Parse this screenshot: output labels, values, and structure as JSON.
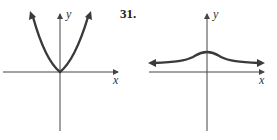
{
  "figures": [
    {
      "id": "left",
      "axis_labels": {
        "x": "x",
        "y": "y"
      },
      "curve": "parabola"
    },
    {
      "id": "right",
      "problem_number": "31.",
      "axis_labels": {
        "x": "x",
        "y": "y"
      },
      "curve": "bell-shaped"
    }
  ],
  "colors": {
    "curve": "#3a3a3a",
    "axis": "#444444"
  }
}
